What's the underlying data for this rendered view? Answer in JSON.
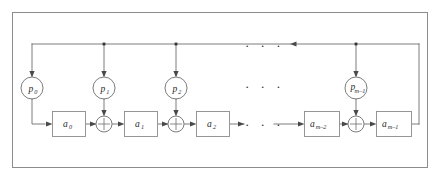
{
  "figure": {
    "kind": "block-diagram",
    "title_visible": "",
    "frame": {
      "border_color": "#8c8c8c",
      "background": "#ffffff"
    },
    "line_color": "#6e6e6e",
    "node_fill": "#ffffff",
    "text_color": "#2b2b2b"
  },
  "taps": [
    {
      "id": "p0",
      "base": "p",
      "sub": "0",
      "cx": 32,
      "cy": 88
    },
    {
      "id": "p1",
      "base": "p",
      "sub": "1",
      "cx": 104,
      "cy": 88
    },
    {
      "id": "p2",
      "base": "p",
      "sub": "2",
      "cx": 176,
      "cy": 88
    },
    {
      "id": "pm1",
      "base": "p",
      "sub": "m–1",
      "cx": 356,
      "cy": 88
    }
  ],
  "stages": [
    {
      "id": "a0",
      "base": "a",
      "sub": "0",
      "x": 52,
      "y": 111,
      "w": 34,
      "h": 26
    },
    {
      "id": "a1",
      "base": "a",
      "sub": "1",
      "x": 124,
      "y": 111,
      "w": 34,
      "h": 26
    },
    {
      "id": "a2",
      "base": "a",
      "sub": "2",
      "x": 196,
      "y": 111,
      "w": 34,
      "h": 26
    },
    {
      "id": "am2",
      "base": "a",
      "sub": "m–2",
      "x": 304,
      "y": 111,
      "w": 36,
      "h": 26
    },
    {
      "id": "am1",
      "base": "a",
      "sub": "m–1",
      "x": 376,
      "y": 111,
      "w": 36,
      "h": 26
    }
  ],
  "adders": [
    {
      "id": "xor0",
      "symbol": "plus-in-circle",
      "cx": 104,
      "cy": 124,
      "r": 8
    },
    {
      "id": "xor1",
      "symbol": "plus-in-circle",
      "cx": 176,
      "cy": 124,
      "r": 8
    },
    {
      "id": "xor2",
      "symbol": "plus-in-circle",
      "cx": 356,
      "cy": 124,
      "r": 8
    }
  ],
  "ellipses": [
    {
      "id": "ellipsis-top",
      "text": "· · ·",
      "x": 258,
      "y": 47
    },
    {
      "id": "ellipsis-middle",
      "text": "· · ·",
      "x": 258,
      "y": 88
    },
    {
      "id": "ellipsis-data",
      "text": "· · ·",
      "x": 258,
      "y": 126
    }
  ],
  "buses": {
    "feedback_label": "feedback bus",
    "feedback_y": 44,
    "feedback_left_x": 32,
    "feedback_right_x": 419,
    "data_y": 124
  }
}
